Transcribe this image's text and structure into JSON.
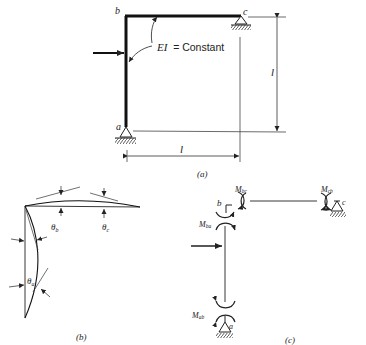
{
  "figure_a": {
    "caption": "(a)",
    "node_labels": {
      "a": "a",
      "b": "b",
      "c": "c"
    },
    "stiffness_label_ei": "EI",
    "stiffness_label_eq": "= Constant",
    "height_dim": "l",
    "width_dim": "l"
  },
  "figure_b": {
    "caption": "(b)",
    "theta_b": "θb",
    "theta_b_main": "θ",
    "theta_b_sub": "b",
    "theta_c_main": "θ",
    "theta_c_sub": "c",
    "theta_a_main": "θ",
    "theta_a_sub": "a"
  },
  "figure_c": {
    "caption": "(c)",
    "node_labels": {
      "a": "a",
      "b": "b",
      "c": "c"
    },
    "moments": {
      "bc_main": "M",
      "bc_sub": "bc",
      "cb_main": "M",
      "cb_sub": "cb",
      "ba_main": "M",
      "ba_sub": "ba",
      "ab_main": "M",
      "ab_sub": "ab"
    }
  },
  "colors": {
    "ink": "#222222",
    "background": "#ffffff"
  }
}
